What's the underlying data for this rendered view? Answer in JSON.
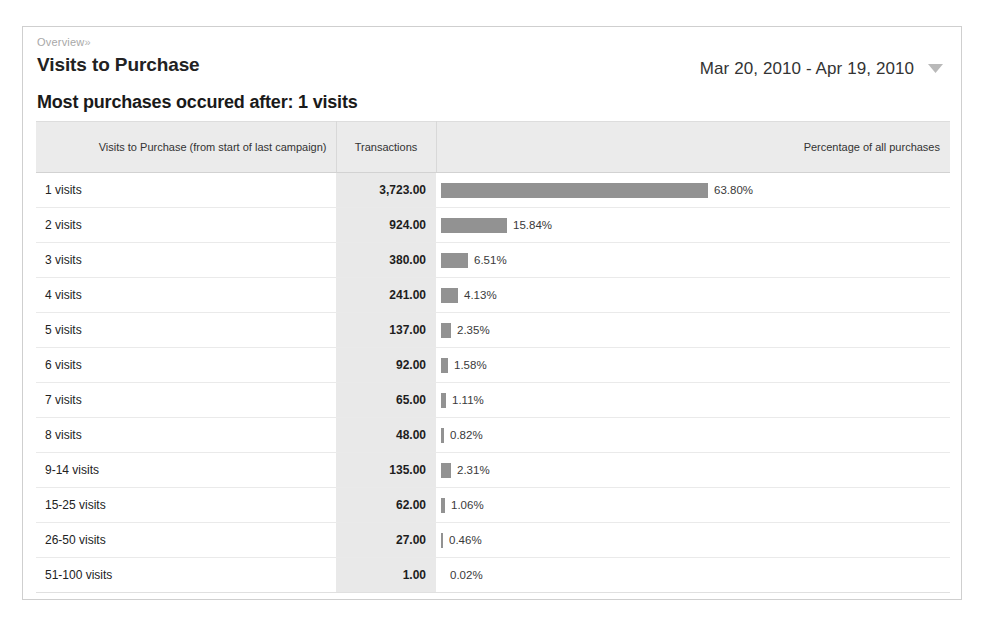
{
  "panel": {
    "breadcrumb": "Overview",
    "breadcrumb_chevron": "»",
    "title": "Visits to Purchase",
    "date_range": "Mar 20, 2010 - Apr 19, 2010",
    "date_range_caret_icon": "chevron-down-icon",
    "headline": "Most purchases occured after: 1 visits"
  },
  "table": {
    "headers": {
      "dimension": "Visits to Purchase (from start of last campaign)",
      "transactions": "Transactions",
      "percentage": "Percentage of all purchases"
    },
    "rows": [
      {
        "dimension": "1 visits",
        "transactions": "3,723.00",
        "percent_label": "63.80%"
      },
      {
        "dimension": "2 visits",
        "transactions": "924.00",
        "percent_label": "15.84%"
      },
      {
        "dimension": "3 visits",
        "transactions": "380.00",
        "percent_label": "6.51%"
      },
      {
        "dimension": "4 visits",
        "transactions": "241.00",
        "percent_label": "4.13%"
      },
      {
        "dimension": "5 visits",
        "transactions": "137.00",
        "percent_label": "2.35%"
      },
      {
        "dimension": "6 visits",
        "transactions": "92.00",
        "percent_label": "1.58%"
      },
      {
        "dimension": "7 visits",
        "transactions": "65.00",
        "percent_label": "1.11%"
      },
      {
        "dimension": "8 visits",
        "transactions": "48.00",
        "percent_label": "0.82%"
      },
      {
        "dimension": "9-14 visits",
        "transactions": "135.00",
        "percent_label": "2.31%"
      },
      {
        "dimension": "15-25 visits",
        "transactions": "62.00",
        "percent_label": "1.06%"
      },
      {
        "dimension": "26-50 visits",
        "transactions": "27.00",
        "percent_label": "0.46%"
      },
      {
        "dimension": "51-100 visits",
        "transactions": "1.00",
        "percent_label": "0.02%"
      }
    ]
  },
  "chart_data": {
    "type": "bar",
    "title": "Visits to Purchase",
    "xlabel": "Percentage of all purchases",
    "ylabel": "Visits to Purchase (from start of last campaign)",
    "categories": [
      "1 visits",
      "2 visits",
      "3 visits",
      "4 visits",
      "5 visits",
      "6 visits",
      "7 visits",
      "8 visits",
      "9-14 visits",
      "15-25 visits",
      "26-50 visits",
      "51-100 visits"
    ],
    "series": [
      {
        "name": "Transactions",
        "values": [
          3723,
          924,
          380,
          241,
          137,
          92,
          65,
          48,
          135,
          62,
          27,
          1
        ]
      },
      {
        "name": "Percentage of all purchases",
        "values": [
          63.8,
          15.84,
          6.51,
          4.13,
          2.35,
          1.58,
          1.11,
          0.82,
          2.31,
          1.06,
          0.46,
          0.02
        ]
      }
    ],
    "bar_full_scale_px": 419,
    "bar_color": "#929292",
    "grid": false,
    "legend": "none"
  },
  "colors": {
    "panel_border": "#cfcfcf",
    "header_fill": "#ebebeb",
    "transactions_column_fill": "#e9e9e9",
    "bar": "#929292",
    "row_divider": "#eaeaea",
    "breadcrumb_text": "#a8a8a8"
  }
}
